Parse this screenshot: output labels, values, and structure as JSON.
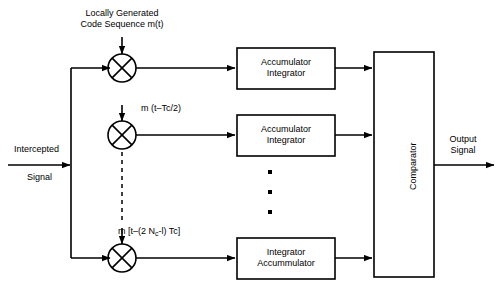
{
  "diagram": {
    "stroke_color": "#000000",
    "background_color": "#ffffff",
    "labels": {
      "local_code_line1": "Locally Generated",
      "local_code_line2": "Code Sequence m(t)",
      "input_line1": "Intercepted",
      "input_line2": "Signal",
      "output_line1": "Output",
      "output_line2": "Signal",
      "mixer2_tap": "m (t–Tc/2)",
      "mixer3_tap_pre": "m [t–(2 N",
      "mixer3_tap_sub": "c",
      "mixer3_tap_post": "-l) Tc]"
    },
    "blocks": [
      {
        "id": "acc-int-1",
        "line1": "Accumulator",
        "line2": "Integrator"
      },
      {
        "id": "acc-int-2",
        "line1": "Accumulator",
        "line2": "Integrator"
      },
      {
        "id": "int-acc-3",
        "line1": "Integrator",
        "line2": "Accummulator"
      }
    ],
    "comparator": {
      "id": "comparator",
      "label": "Comparator",
      "orientation": "vertical"
    },
    "mixers": [
      {
        "id": "mixer-1",
        "symbol": "cross-in-circle"
      },
      {
        "id": "mixer-2",
        "symbol": "cross-in-circle"
      },
      {
        "id": "mixer-3",
        "symbol": "cross-in-circle"
      }
    ],
    "ellipsis": {
      "id": "vertical-ellipsis",
      "dots": 3
    },
    "dashed_connector": {
      "id": "dashed-tap-line",
      "style": "dashed"
    }
  }
}
